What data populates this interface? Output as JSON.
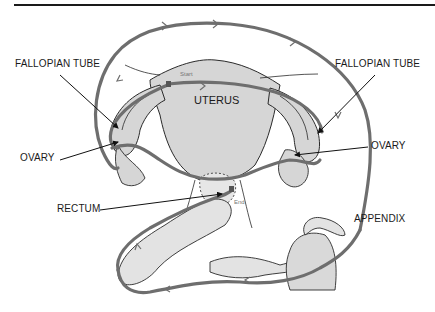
{
  "diagram": {
    "type": "anatomical pathway diagram",
    "labels": {
      "fallopian_tube_left": "FALLOPIAN TUBE",
      "fallopian_tube_right": "FALLOPIAN TUBE",
      "ovary_left": "OVARY",
      "ovary_right": "OVARY",
      "uterus": "UTERUS",
      "rectum": "RECTUM",
      "appendix": "APPENDIX",
      "start": "Start",
      "end": "End"
    },
    "colors": {
      "path": "#6e6e6e",
      "organ_fill": "#d6d6d6",
      "outline": "#2a2a2a",
      "leader": "#111111"
    }
  }
}
